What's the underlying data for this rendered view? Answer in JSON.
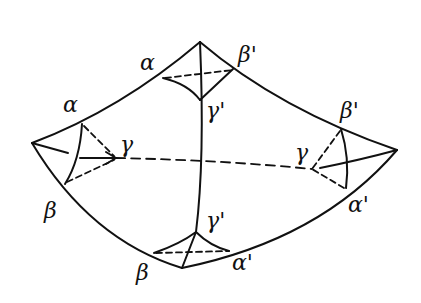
{
  "diagram": {
    "stroke_color": "#111111",
    "background": "#ffffff",
    "labels": {
      "top_alpha": "α",
      "top_beta_prime": "β'",
      "top_gamma_prime": "γ'",
      "left_alpha": "α",
      "left_gamma": "γ",
      "left_beta": "β",
      "right_beta_prime": "β'",
      "right_gamma": "γ",
      "right_alpha_prime": "α'",
      "bottom_gamma_prime": "γ'",
      "bottom_beta": "β",
      "bottom_alpha_prime": "α'"
    }
  }
}
